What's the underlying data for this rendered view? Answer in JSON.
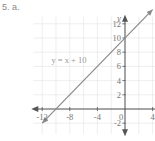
{
  "problem_label": "5. a.",
  "chart_data": {
    "type": "line",
    "title": "",
    "xlabel": "x",
    "ylabel": "y",
    "xlim": [
      -13,
      5
    ],
    "ylim": [
      -3,
      13
    ],
    "grid": true,
    "x_ticks": [
      -12,
      -8,
      -4,
      0,
      4
    ],
    "x_tick_labels": [
      "-12",
      "-8",
      "-4",
      "0",
      "4"
    ],
    "y_ticks": [
      -2,
      2,
      4,
      6,
      8,
      10,
      12
    ],
    "y_tick_labels": [
      "-2",
      "2",
      "4",
      "6",
      "8",
      "10",
      "12"
    ],
    "series": [
      {
        "name": "y = x + 10",
        "equation": "y = x + 10",
        "slope": 1,
        "intercept": 10,
        "x": [
          -12,
          4
        ],
        "y": [
          -2,
          14
        ],
        "arrows": "both"
      }
    ],
    "annotations": [
      {
        "text": "y = x + 10",
        "x": -9.5,
        "y": 6.5
      }
    ],
    "colors": {
      "line": "#8a8a8a",
      "axis": "#555555",
      "grid": "#e3e3e3"
    }
  }
}
